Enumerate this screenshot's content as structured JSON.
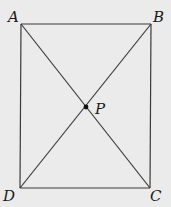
{
  "diagram": {
    "type": "rectangle-with-diagonals",
    "vertices": {
      "A": {
        "label": "A",
        "x": 21,
        "y": 24
      },
      "B": {
        "label": "B",
        "x": 151,
        "y": 24
      },
      "C": {
        "label": "C",
        "x": 150,
        "y": 188
      },
      "D": {
        "label": "D",
        "x": 20,
        "y": 188
      }
    },
    "intersection": {
      "label": "P",
      "x": 86,
      "y": 107
    },
    "segments": [
      "AB",
      "BC",
      "CD",
      "DA",
      "AC",
      "BD"
    ],
    "colors": {
      "background": "#ebebeb",
      "line": "#3a3a3a"
    }
  }
}
